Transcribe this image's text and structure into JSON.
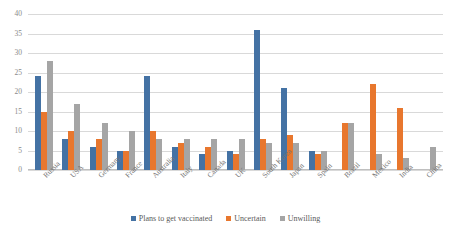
{
  "chart_data": {
    "type": "bar",
    "title": "",
    "xlabel": "",
    "ylabel": "",
    "ylim": [
      0,
      40
    ],
    "yticks": [
      0,
      5,
      10,
      15,
      20,
      25,
      30,
      35,
      40
    ],
    "grid": true,
    "legend_position": "bottom",
    "categories": [
      "Russia",
      "USA",
      "Germany",
      "France",
      "Australia",
      "Italy",
      "Canada",
      "UK",
      "South Korea",
      "Japan",
      "Spain",
      "Brazil",
      "Mexico",
      "India",
      "China"
    ],
    "series": [
      {
        "name": "Plans to get vaccinated",
        "color": "#4472a4",
        "values": [
          24,
          8,
          6,
          5,
          24,
          6,
          4,
          5,
          36,
          21,
          5,
          0,
          0,
          0,
          0
        ]
      },
      {
        "name": "Uncertain",
        "color": "#e8772e",
        "values": [
          15,
          10,
          8,
          5,
          10,
          7,
          6,
          4,
          8,
          9,
          4,
          12,
          22,
          16,
          0
        ]
      },
      {
        "name": "Unwilling",
        "color": "#a5a5a5",
        "values": [
          28,
          17,
          12,
          10,
          8,
          8,
          8,
          8,
          7,
          7,
          5,
          12,
          4,
          3,
          6
        ]
      }
    ]
  }
}
